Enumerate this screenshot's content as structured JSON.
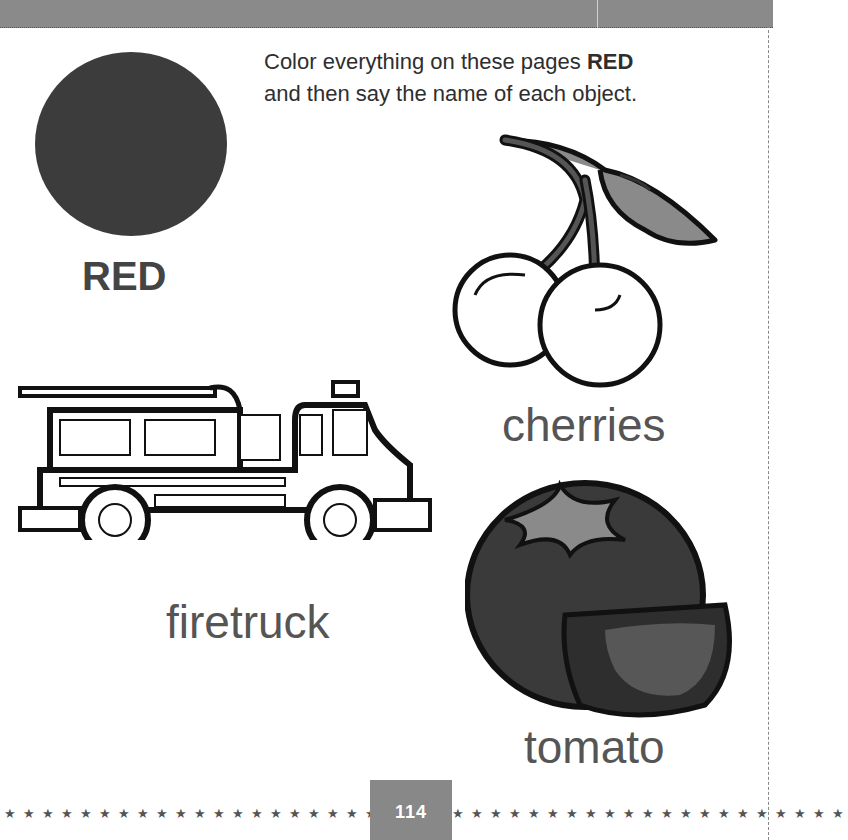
{
  "page": {
    "instruction": {
      "prefix": "Color everything on these pages ",
      "emphasis": "RED",
      "line2": "and then say the name of each object."
    },
    "color_swatch": {
      "name": "RED",
      "fill": "#3c3c3c"
    },
    "objects": [
      {
        "id": "cherries",
        "label": "cherries"
      },
      {
        "id": "firetruck",
        "label": "firetruck"
      },
      {
        "id": "tomato",
        "label": "tomato"
      }
    ],
    "footer": {
      "page_number": "114",
      "stars_left": "★★★★★★★★★★★★★★★★★★★★★★★★",
      "stars_right": "★★★★★★★★★★★★★★★★★★★★★"
    },
    "colors": {
      "top_bar": "#8a8a8a",
      "page_box": "#888888",
      "text": "#555555"
    }
  }
}
